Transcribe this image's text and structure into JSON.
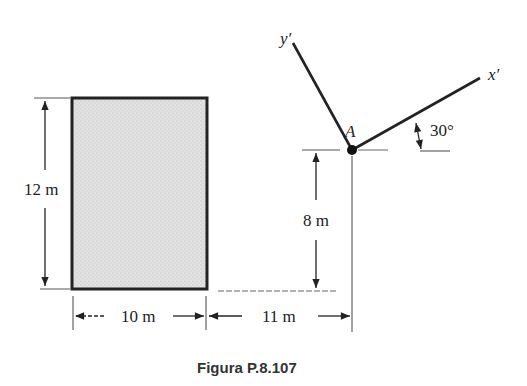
{
  "figure": {
    "caption": "Figura P.8.107",
    "shape": "rectangle (shaded area)",
    "point_label": "A",
    "axes": {
      "x_prime": "x′",
      "y_prime": "y′"
    },
    "angle_label": "30°",
    "dimensions": {
      "height": "12 m",
      "width": "10 m",
      "horizontal_offset": "11 m",
      "vertical_offset": "8 m"
    },
    "colors": {
      "fill": "#d9d9d9",
      "stroke": "#222222"
    }
  }
}
